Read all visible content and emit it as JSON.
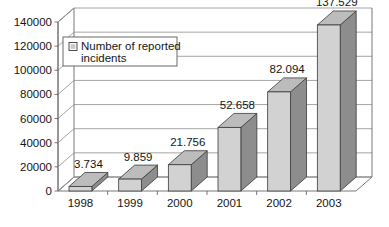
{
  "chart_data": {
    "type": "bar",
    "title": "",
    "subtitle": "",
    "xlabel": "",
    "ylabel": "",
    "categories": [
      "1998",
      "1999",
      "2000",
      "2001",
      "2002",
      "2003"
    ],
    "values": [
      3734,
      9859,
      21756,
      52658,
      82094,
      137529
    ],
    "point_labels": [
      "3.734",
      "9.859",
      "21.756",
      "52.658",
      "82.094",
      "137.529"
    ],
    "series": [
      {
        "name": "Number of reported incidents",
        "values": [
          3734,
          9859,
          21756,
          52658,
          82094,
          137529
        ]
      }
    ],
    "ylim": [
      0,
      140000
    ],
    "ytick_values": [
      0,
      20000,
      40000,
      60000,
      80000,
      100000,
      120000,
      140000
    ],
    "ytick_labels": [
      "0",
      "20000",
      "40000",
      "60000",
      "80000",
      "100000",
      "120000",
      "140000"
    ],
    "grid": true,
    "grid_axis": "y",
    "legend": {
      "position": "inside-top-left",
      "entries": [
        "Number of reported incidents"
      ],
      "label_line_1": "Number of reported",
      "label_line_2": "incidents"
    },
    "style": "3d-column",
    "colors": {
      "bar_front": "#d2d2d2",
      "bar_side": "#8d8d8d",
      "bar_top": "#bcbcbc",
      "bar_outline": "#3a3a3a",
      "gridline": "#8e8e8e",
      "axis": "#6a6a6a",
      "text": "#151515",
      "background": "#ffffff",
      "legend_swatch": "#c9c9c9"
    }
  }
}
